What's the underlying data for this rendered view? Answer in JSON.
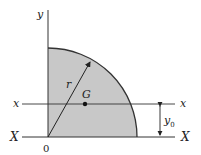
{
  "diagram": {
    "type": "quarter-circle-area",
    "labels": {
      "y_axis": "y",
      "x_centroidal_left": "x",
      "x_centroidal_right": "x",
      "X_base_left": "X",
      "X_base_right": "X",
      "radius": "r",
      "centroid": "G",
      "origin": "0",
      "offset": "y",
      "offset_sub": "0"
    },
    "colors": {
      "fill": "#c8c8c8",
      "stroke": "#333333",
      "background": "#ffffff"
    }
  }
}
